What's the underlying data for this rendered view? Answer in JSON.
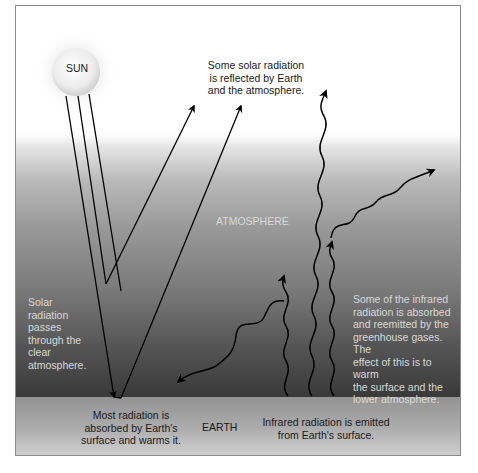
{
  "diagram": {
    "labels": {
      "sun": "SUN",
      "reflected": [
        "Some solar radiation",
        "is reflected by Earth",
        "and the atmosphere."
      ],
      "atmosphere": "ATMOSPHERE",
      "solar_passes": [
        "Solar",
        "radiation",
        "passes",
        "through the",
        "clear",
        "atmosphere."
      ],
      "absorbed_reemitted": [
        "Some of the infrared",
        "radiation is absorbed",
        "and reemitted by the",
        "greenhouse gases. The",
        "effect of this is to warm",
        "the surface and the",
        "lower atmosphere."
      ],
      "absorbed_surface": [
        "Most radiation is",
        "absorbed by Earth's",
        "surface and warms it."
      ],
      "earth": "EARTH",
      "infrared_emitted": [
        "Infrared radiation is emitted",
        "from Earth's surface."
      ]
    },
    "colors": {
      "sky_top": "#ffffff",
      "atmosphere_bottom": "#3a3a3a",
      "ground": "#a5a5a5",
      "arrow": "#000000",
      "light_text": "#d9d9d9",
      "dark_text": "#1a1a1a"
    }
  }
}
